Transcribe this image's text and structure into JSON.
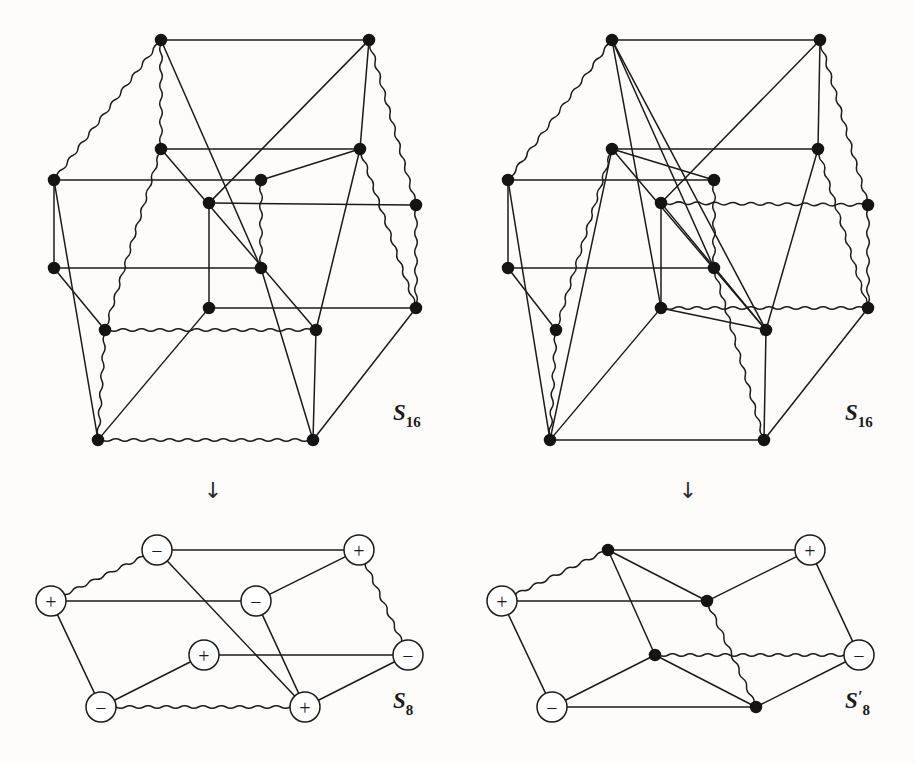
{
  "figure": {
    "background_color": "#fdfcfa",
    "ink_color": "#1b1b1b",
    "node_fill": "#141414",
    "edge_stroke_width": 1.5,
    "solid_node_radius": 8,
    "circle_node_radius": 15,
    "arrow_glyph": "↓"
  },
  "panels": [
    {
      "id": "top-left",
      "label": "S",
      "label_sub": "16",
      "label_prime": "",
      "label_x": 393,
      "label_y": 420,
      "node_style": "solid",
      "nodes": [
        {
          "id": "a0",
          "x": 161,
          "y": 40
        },
        {
          "id": "a1",
          "x": 369,
          "y": 40
        },
        {
          "id": "b0",
          "x": 161,
          "y": 149
        },
        {
          "id": "b1",
          "x": 360,
          "y": 149
        },
        {
          "id": "c0",
          "x": 54,
          "y": 180
        },
        {
          "id": "c1",
          "x": 261,
          "y": 180
        },
        {
          "id": "d0",
          "x": 209,
          "y": 203
        },
        {
          "id": "d1",
          "x": 416,
          "y": 205
        },
        {
          "id": "e0",
          "x": 54,
          "y": 268
        },
        {
          "id": "e1",
          "x": 261,
          "y": 268
        },
        {
          "id": "f0",
          "x": 209,
          "y": 308
        },
        {
          "id": "f1",
          "x": 416,
          "y": 308
        },
        {
          "id": "g0",
          "x": 105,
          "y": 330
        },
        {
          "id": "g1",
          "x": 316,
          "y": 330
        },
        {
          "id": "h0",
          "x": 98,
          "y": 440
        },
        {
          "id": "h1",
          "x": 313,
          "y": 440
        }
      ],
      "edges": [
        {
          "from": "a0",
          "to": "a1",
          "type": "solid"
        },
        {
          "from": "a0",
          "to": "c0",
          "type": "wavy"
        },
        {
          "from": "a0",
          "to": "b0",
          "type": "wavy"
        },
        {
          "from": "a0",
          "to": "e1",
          "type": "solid"
        },
        {
          "from": "a1",
          "to": "b1",
          "type": "solid"
        },
        {
          "from": "a1",
          "to": "d1",
          "type": "wavy"
        },
        {
          "from": "a1",
          "to": "d0",
          "type": "solid"
        },
        {
          "from": "b0",
          "to": "b1",
          "type": "solid"
        },
        {
          "from": "b0",
          "to": "g0",
          "type": "wavy"
        },
        {
          "from": "b0",
          "to": "g1",
          "type": "solid"
        },
        {
          "from": "b1",
          "to": "f1",
          "type": "wavy"
        },
        {
          "from": "b1",
          "to": "g1",
          "type": "solid"
        },
        {
          "from": "c0",
          "to": "c1",
          "type": "solid"
        },
        {
          "from": "c0",
          "to": "e0",
          "type": "solid"
        },
        {
          "from": "c0",
          "to": "h0",
          "type": "solid"
        },
        {
          "from": "c1",
          "to": "e1",
          "type": "wavy"
        },
        {
          "from": "c1",
          "to": "b1",
          "type": "solid"
        },
        {
          "from": "d0",
          "to": "d1",
          "type": "solid"
        },
        {
          "from": "d0",
          "to": "f0",
          "type": "solid"
        },
        {
          "from": "d1",
          "to": "f1",
          "type": "wavy"
        },
        {
          "from": "e0",
          "to": "e1",
          "type": "solid"
        },
        {
          "from": "e0",
          "to": "g0",
          "type": "solid"
        },
        {
          "from": "e1",
          "to": "h1",
          "type": "solid"
        },
        {
          "from": "f0",
          "to": "f1",
          "type": "solid"
        },
        {
          "from": "f0",
          "to": "h0",
          "type": "solid"
        },
        {
          "from": "f1",
          "to": "h1",
          "type": "solid"
        },
        {
          "from": "g0",
          "to": "g1",
          "type": "wavy"
        },
        {
          "from": "g0",
          "to": "h0",
          "type": "wavy"
        },
        {
          "from": "g1",
          "to": "h1",
          "type": "solid"
        },
        {
          "from": "h0",
          "to": "h1",
          "type": "wavy"
        }
      ]
    },
    {
      "id": "top-right",
      "label": "S",
      "label_sub": "16",
      "label_prime": "",
      "label_x": 845,
      "label_y": 420,
      "node_style": "solid",
      "nodes": [
        {
          "id": "a0",
          "x": 612,
          "y": 40
        },
        {
          "id": "a1",
          "x": 820,
          "y": 40
        },
        {
          "id": "b0",
          "x": 612,
          "y": 149
        },
        {
          "id": "b1",
          "x": 818,
          "y": 149
        },
        {
          "id": "c0",
          "x": 508,
          "y": 180
        },
        {
          "id": "c1",
          "x": 714,
          "y": 180
        },
        {
          "id": "d0",
          "x": 661,
          "y": 203
        },
        {
          "id": "d1",
          "x": 868,
          "y": 205
        },
        {
          "id": "e0",
          "x": 508,
          "y": 268
        },
        {
          "id": "e1",
          "x": 714,
          "y": 268
        },
        {
          "id": "f0",
          "x": 661,
          "y": 308
        },
        {
          "id": "f1",
          "x": 868,
          "y": 308
        },
        {
          "id": "g0",
          "x": 556,
          "y": 330
        },
        {
          "id": "g1",
          "x": 766,
          "y": 330
        },
        {
          "id": "h0",
          "x": 550,
          "y": 440
        },
        {
          "id": "h1",
          "x": 764,
          "y": 440
        }
      ],
      "edges": [
        {
          "from": "a0",
          "to": "a1",
          "type": "solid"
        },
        {
          "from": "a0",
          "to": "c0",
          "type": "wavy"
        },
        {
          "from": "a0",
          "to": "e1",
          "type": "solid"
        },
        {
          "from": "a0",
          "to": "f0",
          "type": "solid"
        },
        {
          "from": "a0",
          "to": "g1",
          "type": "solid"
        },
        {
          "from": "a1",
          "to": "b1",
          "type": "solid"
        },
        {
          "from": "a1",
          "to": "d1",
          "type": "wavy"
        },
        {
          "from": "a1",
          "to": "d0",
          "type": "solid"
        },
        {
          "from": "b0",
          "to": "b1",
          "type": "solid"
        },
        {
          "from": "b0",
          "to": "c1",
          "type": "solid"
        },
        {
          "from": "b0",
          "to": "g0",
          "type": "wavy"
        },
        {
          "from": "b0",
          "to": "h0",
          "type": "solid"
        },
        {
          "from": "b0",
          "to": "g1",
          "type": "solid"
        },
        {
          "from": "b1",
          "to": "f1",
          "type": "wavy"
        },
        {
          "from": "b1",
          "to": "g1",
          "type": "solid"
        },
        {
          "from": "c0",
          "to": "c1",
          "type": "solid"
        },
        {
          "from": "c0",
          "to": "e0",
          "type": "solid"
        },
        {
          "from": "c0",
          "to": "h0",
          "type": "solid"
        },
        {
          "from": "c1",
          "to": "e1",
          "type": "wavy"
        },
        {
          "from": "d0",
          "to": "d1",
          "type": "wavy"
        },
        {
          "from": "d0",
          "to": "f0",
          "type": "solid"
        },
        {
          "from": "d0",
          "to": "g1",
          "type": "solid"
        },
        {
          "from": "d1",
          "to": "f1",
          "type": "wavy"
        },
        {
          "from": "e0",
          "to": "e1",
          "type": "solid"
        },
        {
          "from": "e0",
          "to": "g0",
          "type": "solid"
        },
        {
          "from": "e1",
          "to": "h1",
          "type": "wavy"
        },
        {
          "from": "f0",
          "to": "f1",
          "type": "wavy"
        },
        {
          "from": "f0",
          "to": "g1",
          "type": "solid"
        },
        {
          "from": "f0",
          "to": "h0",
          "type": "solid"
        },
        {
          "from": "f1",
          "to": "h1",
          "type": "solid"
        },
        {
          "from": "g0",
          "to": "h0",
          "type": "wavy"
        },
        {
          "from": "g1",
          "to": "h1",
          "type": "solid"
        },
        {
          "from": "h0",
          "to": "h1",
          "type": "solid"
        }
      ]
    },
    {
      "id": "bottom-left",
      "label": "S",
      "label_sub": "8",
      "label_prime": "",
      "label_x": 393,
      "label_y": 708,
      "node_style": "signed",
      "nodes": [
        {
          "id": "p0",
          "x": 157,
          "y": 550,
          "sign": "−"
        },
        {
          "id": "p1",
          "x": 359,
          "y": 550,
          "sign": "+"
        },
        {
          "id": "p2",
          "x": 51,
          "y": 601,
          "sign": "+"
        },
        {
          "id": "p3",
          "x": 256,
          "y": 601,
          "sign": "−"
        },
        {
          "id": "p4",
          "x": 204,
          "y": 655,
          "sign": "+"
        },
        {
          "id": "p5",
          "x": 408,
          "y": 655,
          "sign": "−"
        },
        {
          "id": "p6",
          "x": 101,
          "y": 707,
          "sign": "−"
        },
        {
          "id": "p7",
          "x": 305,
          "y": 707,
          "sign": "+"
        }
      ],
      "edges": [
        {
          "from": "p0",
          "to": "p1",
          "type": "solid"
        },
        {
          "from": "p0",
          "to": "p2",
          "type": "wavy"
        },
        {
          "from": "p0",
          "to": "p7",
          "type": "solid"
        },
        {
          "from": "p1",
          "to": "p3",
          "type": "solid"
        },
        {
          "from": "p1",
          "to": "p5",
          "type": "wavy"
        },
        {
          "from": "p2",
          "to": "p3",
          "type": "solid"
        },
        {
          "from": "p2",
          "to": "p6",
          "type": "solid"
        },
        {
          "from": "p3",
          "to": "p7",
          "type": "solid"
        },
        {
          "from": "p4",
          "to": "p5",
          "type": "solid"
        },
        {
          "from": "p4",
          "to": "p6",
          "type": "solid"
        },
        {
          "from": "p5",
          "to": "p7",
          "type": "solid"
        },
        {
          "from": "p6",
          "to": "p7",
          "type": "wavy"
        }
      ]
    },
    {
      "id": "bottom-right",
      "label": "S",
      "label_sub": "8",
      "label_prime": "′",
      "label_x": 845,
      "label_y": 708,
      "node_style": "mixed",
      "nodes": [
        {
          "id": "p0",
          "x": 608,
          "y": 550,
          "sign": ""
        },
        {
          "id": "p1",
          "x": 810,
          "y": 550,
          "sign": "+"
        },
        {
          "id": "p2",
          "x": 502,
          "y": 601,
          "sign": "+"
        },
        {
          "id": "p3",
          "x": 707,
          "y": 601,
          "sign": ""
        },
        {
          "id": "p4",
          "x": 655,
          "y": 655,
          "sign": ""
        },
        {
          "id": "p5",
          "x": 859,
          "y": 655,
          "sign": "−"
        },
        {
          "id": "p6",
          "x": 552,
          "y": 707,
          "sign": "−"
        },
        {
          "id": "p7",
          "x": 756,
          "y": 707,
          "sign": ""
        }
      ],
      "edges": [
        {
          "from": "p0",
          "to": "p1",
          "type": "solid"
        },
        {
          "from": "p0",
          "to": "p2",
          "type": "wavy"
        },
        {
          "from": "p0",
          "to": "p3",
          "type": "solid"
        },
        {
          "from": "p0",
          "to": "p4",
          "type": "solid"
        },
        {
          "from": "p1",
          "to": "p3",
          "type": "solid"
        },
        {
          "from": "p1",
          "to": "p5",
          "type": "solid"
        },
        {
          "from": "p2",
          "to": "p3",
          "type": "solid"
        },
        {
          "from": "p2",
          "to": "p6",
          "type": "solid"
        },
        {
          "from": "p3",
          "to": "p7",
          "type": "wavy"
        },
        {
          "from": "p4",
          "to": "p5",
          "type": "wavy"
        },
        {
          "from": "p4",
          "to": "p6",
          "type": "solid"
        },
        {
          "from": "p4",
          "to": "p7",
          "type": "solid"
        },
        {
          "from": "p5",
          "to": "p7",
          "type": "solid"
        },
        {
          "from": "p6",
          "to": "p7",
          "type": "solid"
        }
      ]
    }
  ],
  "arrows": [
    {
      "id": "arrow-left",
      "x": 213,
      "y": 498,
      "glyph": "↓"
    },
    {
      "id": "arrow-right",
      "x": 688,
      "y": 498,
      "glyph": "↓"
    }
  ]
}
